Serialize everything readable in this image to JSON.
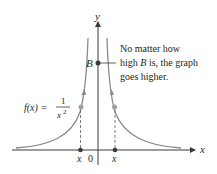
{
  "diagram": {
    "function_label": {
      "lhs": "f(x) = ",
      "numerator": "1",
      "denominator_base": "x",
      "denominator_exp": "2"
    },
    "axes": {
      "x_label": "x",
      "y_label": "y",
      "origin_label": "0"
    },
    "points": {
      "B_label": "B",
      "left_x_label": "x",
      "right_x_label": "x"
    },
    "annotation": {
      "line1": "No matter how",
      "line2_pre": "high ",
      "line2_var": "B",
      "line2_post": " is, the graph",
      "line3": "goes higher."
    },
    "colors": {
      "curve": "#8a8a8a",
      "axis": "#3a3a3a",
      "point": "#3a3a3a",
      "highlight_point": "#a0a0a0",
      "text": "#231f20"
    }
  }
}
